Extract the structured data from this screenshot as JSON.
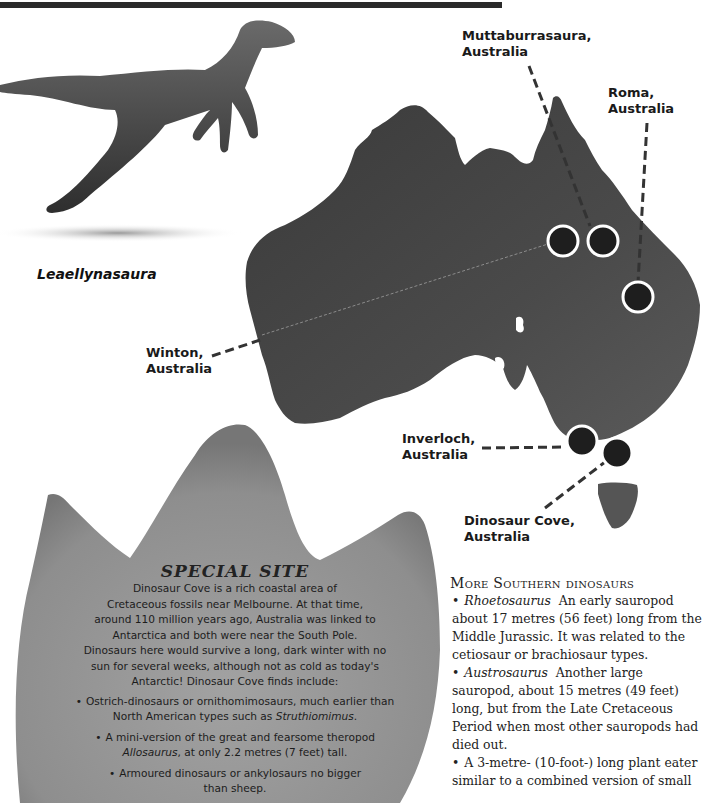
{
  "page": {
    "top_bar_color": "#2a2a2a"
  },
  "illustration": {
    "name": "Leaellynasaura",
    "caption": "Leaellynasaura"
  },
  "map": {
    "region": "Australia",
    "marker_color": "#1e1e1e",
    "marker_ring_color": "#ffffff",
    "labels": [
      {
        "id": "muttaburrasaura",
        "line1": "Muttaburrasaura,",
        "line2": "Australia"
      },
      {
        "id": "roma",
        "line1": "Roma,",
        "line2": "Australia"
      },
      {
        "id": "winton",
        "line1": "Winton,",
        "line2": "Australia"
      },
      {
        "id": "inverloch",
        "line1": "Inverloch,",
        "line2": "Australia"
      },
      {
        "id": "dinosaur-cove",
        "line1": "Dinosaur Cove,",
        "line2": "Australia"
      }
    ]
  },
  "special_site": {
    "title": "SPECIAL SITE",
    "body_lines": [
      "Dinosaur Cove is a rich coastal area of",
      "Cretaceous fossils near Melbourne. At that time,",
      "around 110 million years ago, Australia was linked to",
      "Antarctica and both were near the South Pole.",
      "Dinosaurs here would survive a long, dark winter with no",
      "sun for several weeks, although not as cold as today's",
      "Antarctic! Dinosaur Cove finds include:"
    ],
    "items": [
      {
        "bullet": "•",
        "line1": "Ostrich-dinosaurs or ornithomimosaurs, much earlier than",
        "line2_pre": "North American types such as ",
        "line2_em": "Struthiomimus",
        "line2_post": "."
      },
      {
        "bullet": "•",
        "line1": "A mini-version of the great and fearsome theropod",
        "line2_pre": "",
        "line2_em": "Allosaurus",
        "line2_post": ", at only 2.2 metres (7 feet) tall."
      },
      {
        "bullet": "•",
        "line1": "Armoured dinosaurs or ankylosaurs no bigger",
        "line2_pre": "than sheep.",
        "line2_em": "",
        "line2_post": ""
      }
    ],
    "fill_color": "#8c8c8c"
  },
  "more_southern": {
    "title": "More Southern dinosaurs",
    "items": [
      {
        "bullet": "•",
        "name": "Rhoetosaurus",
        "text": "An early sauropod about 17 metres (56 feet) long from the Middle Jurassic. It was related to the cetiosaur or brachiosaur types."
      },
      {
        "bullet": "•",
        "name": "Austrosaurus",
        "text": "Another large sauropod, about 15 metres (49 feet) long, but from the Late Cretaceous Period when most other sauropods had died out."
      },
      {
        "bullet": "•",
        "name": "",
        "text": "A 3-metre- (10-foot-) long plant eater similar to a combined version of small"
      }
    ]
  }
}
